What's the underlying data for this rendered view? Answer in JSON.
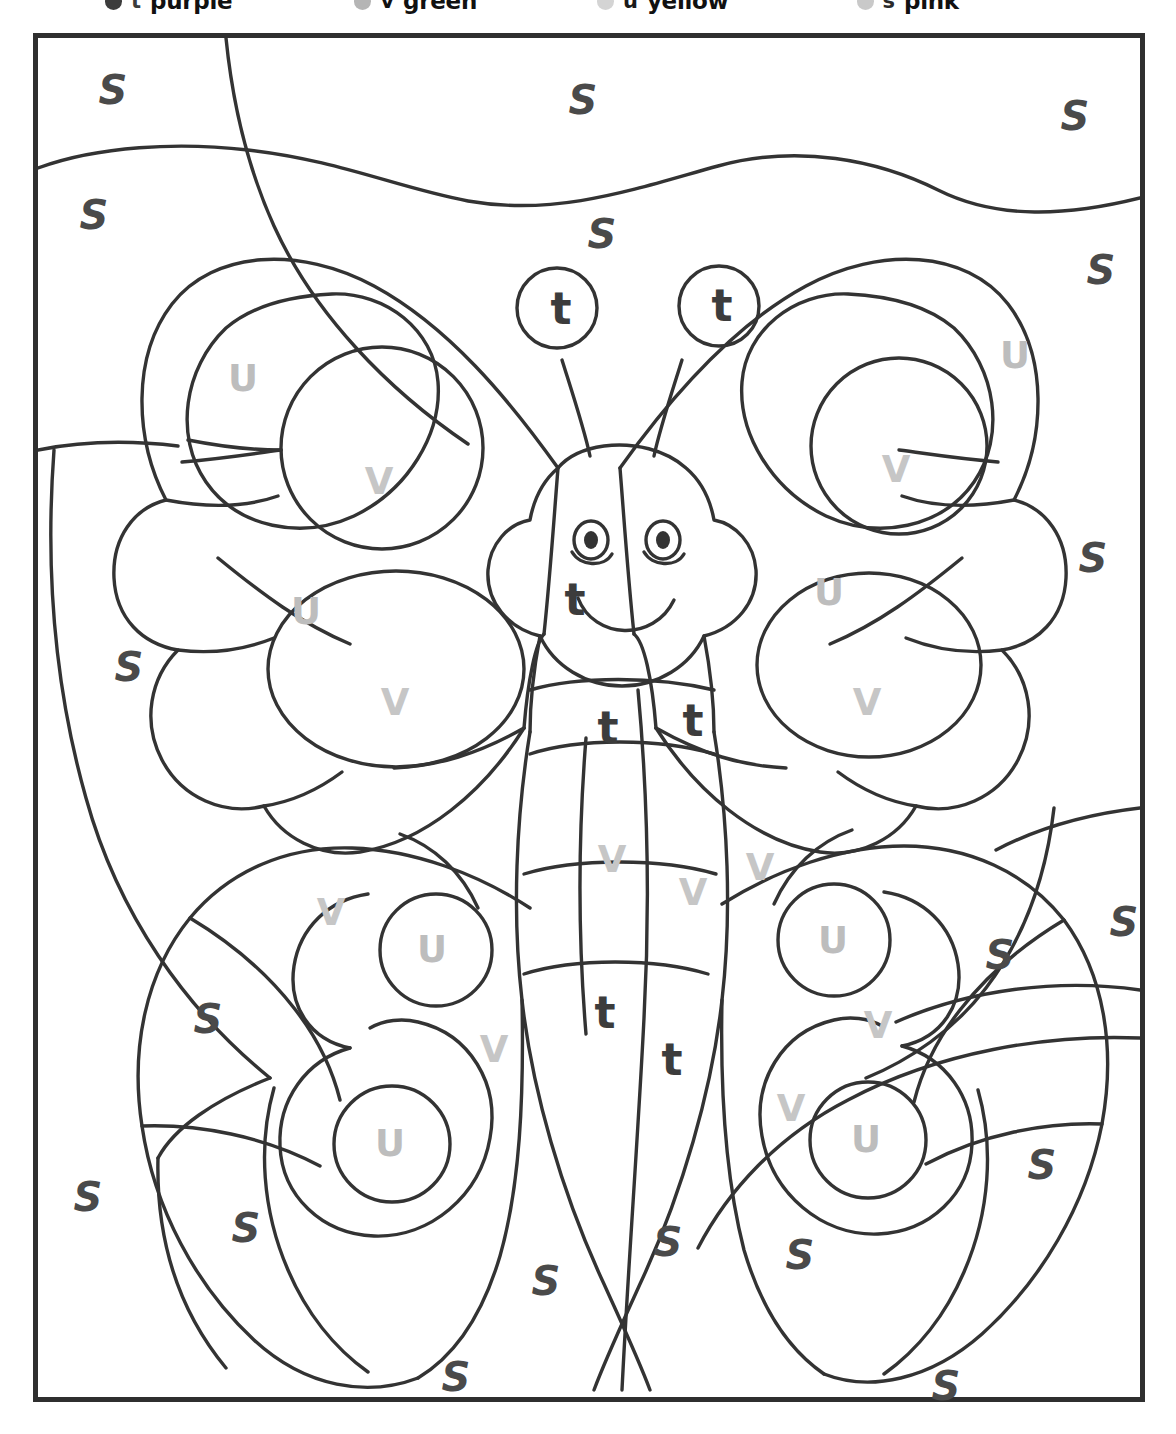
{
  "worksheet": {
    "title": "Color By Letter Butterfly",
    "type": "color-by-letter coloring page"
  },
  "legend": {
    "note": "legend row is cropped at the top edge of the page; only the lower sliver of the dots and words is visible",
    "items": [
      {
        "letter": "t",
        "color_name": "purple",
        "swatch": "#3c3c3c",
        "letter_color": "#3c3c3c"
      },
      {
        "letter": "v",
        "color_name": "green",
        "swatch": "#b5b5b5",
        "letter_color": "#111111"
      },
      {
        "letter": "u",
        "color_name": "yellow",
        "swatch": "#d4d4d4",
        "letter_color": "#1a1a1a"
      },
      {
        "letter": "s",
        "color_name": "pink",
        "swatch": "#c9c9c9",
        "letter_color": "#2a2a2a"
      }
    ]
  },
  "frame": {
    "border_color": "#2f2f2f",
    "line_color": "#333333",
    "background": "#ffffff"
  },
  "letter_colors": {
    "s": "#4a4a4a",
    "u": "#bdbdbd",
    "v": "#c6c6c6",
    "t": "#3c3c3c"
  },
  "letters": [
    {
      "id": "s-01",
      "char": "S",
      "kind": "s",
      "x": 75,
      "y": 52
    },
    {
      "id": "s-02",
      "char": "S",
      "kind": "s",
      "x": 545,
      "y": 62
    },
    {
      "id": "s-03",
      "char": "S",
      "kind": "s",
      "x": 1037,
      "y": 78
    },
    {
      "id": "s-04",
      "char": "S",
      "kind": "s",
      "x": 56,
      "y": 177
    },
    {
      "id": "s-05",
      "char": "S",
      "kind": "s",
      "x": 564,
      "y": 196
    },
    {
      "id": "s-06",
      "char": "S",
      "kind": "s",
      "x": 1063,
      "y": 232
    },
    {
      "id": "s-07",
      "char": "S",
      "kind": "s",
      "x": 1055,
      "y": 520
    },
    {
      "id": "s-08",
      "char": "S",
      "kind": "s",
      "x": 91,
      "y": 629
    },
    {
      "id": "s-09",
      "char": "S",
      "kind": "s",
      "x": 1086,
      "y": 884
    },
    {
      "id": "s-10",
      "char": "S",
      "kind": "s",
      "x": 962,
      "y": 917
    },
    {
      "id": "s-11",
      "char": "S",
      "kind": "s",
      "x": 170,
      "y": 981
    },
    {
      "id": "s-12",
      "char": "S",
      "kind": "s",
      "x": 1004,
      "y": 1127
    },
    {
      "id": "s-13",
      "char": "S",
      "kind": "s",
      "x": 50,
      "y": 1159
    },
    {
      "id": "s-14",
      "char": "S",
      "kind": "s",
      "x": 208,
      "y": 1190
    },
    {
      "id": "s-15",
      "char": "S",
      "kind": "s",
      "x": 630,
      "y": 1204
    },
    {
      "id": "s-16",
      "char": "S",
      "kind": "s",
      "x": 762,
      "y": 1217
    },
    {
      "id": "s-17",
      "char": "S",
      "kind": "s",
      "x": 508,
      "y": 1243
    },
    {
      "id": "s-18",
      "char": "S",
      "kind": "s",
      "x": 418,
      "y": 1339
    },
    {
      "id": "s-19",
      "char": "S",
      "kind": "s",
      "x": 908,
      "y": 1348
    },
    {
      "id": "u-01",
      "char": "U",
      "kind": "u",
      "x": 205,
      "y": 340
    },
    {
      "id": "u-02",
      "char": "U",
      "kind": "u",
      "x": 977,
      "y": 317
    },
    {
      "id": "u-03",
      "char": "U",
      "kind": "u",
      "x": 268,
      "y": 573
    },
    {
      "id": "u-04",
      "char": "U",
      "kind": "u",
      "x": 791,
      "y": 554
    },
    {
      "id": "u-05",
      "char": "U",
      "kind": "u",
      "x": 394,
      "y": 911
    },
    {
      "id": "u-06",
      "char": "U",
      "kind": "u",
      "x": 795,
      "y": 902
    },
    {
      "id": "u-07",
      "char": "U",
      "kind": "u",
      "x": 352,
      "y": 1105
    },
    {
      "id": "u-08",
      "char": "U",
      "kind": "u",
      "x": 828,
      "y": 1101
    },
    {
      "id": "v-01",
      "char": "V",
      "kind": "v",
      "x": 341,
      "y": 443
    },
    {
      "id": "v-02",
      "char": "V",
      "kind": "v",
      "x": 858,
      "y": 431
    },
    {
      "id": "v-03",
      "char": "V",
      "kind": "v",
      "x": 357,
      "y": 664
    },
    {
      "id": "v-04",
      "char": "V",
      "kind": "v",
      "x": 829,
      "y": 664
    },
    {
      "id": "v-05",
      "char": "V",
      "kind": "v",
      "x": 574,
      "y": 821
    },
    {
      "id": "v-06",
      "char": "V",
      "kind": "v",
      "x": 655,
      "y": 854
    },
    {
      "id": "v-07",
      "char": "V",
      "kind": "v",
      "x": 722,
      "y": 829
    },
    {
      "id": "v-08",
      "char": "V",
      "kind": "v",
      "x": 293,
      "y": 874
    },
    {
      "id": "v-09",
      "char": "V",
      "kind": "v",
      "x": 456,
      "y": 1011
    },
    {
      "id": "v-10",
      "char": "V",
      "kind": "v",
      "x": 840,
      "y": 987
    },
    {
      "id": "v-11",
      "char": "V",
      "kind": "v",
      "x": 753,
      "y": 1070
    },
    {
      "id": "t-01",
      "char": "t",
      "kind": "t",
      "x": 523,
      "y": 271
    },
    {
      "id": "t-02",
      "char": "t",
      "kind": "t",
      "x": 684,
      "y": 268
    },
    {
      "id": "t-03",
      "char": "t",
      "kind": "t",
      "x": 537,
      "y": 562
    },
    {
      "id": "t-04",
      "char": "t",
      "kind": "t",
      "x": 570,
      "y": 690
    },
    {
      "id": "t-05",
      "char": "t",
      "kind": "t",
      "x": 655,
      "y": 683
    },
    {
      "id": "t-06",
      "char": "t",
      "kind": "t",
      "x": 567,
      "y": 975
    },
    {
      "id": "t-07",
      "char": "t",
      "kind": "t",
      "x": 634,
      "y": 1022
    }
  ]
}
